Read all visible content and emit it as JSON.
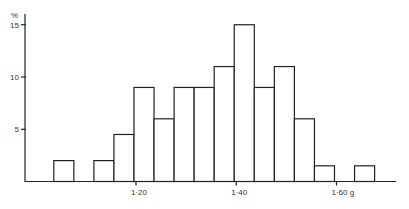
{
  "chart_data": {
    "type": "bar",
    "title": "",
    "xlabel": "g",
    "ylabel": "%",
    "ylim": [
      0,
      16
    ],
    "yticks": [
      5,
      10,
      15
    ],
    "ytick_labels": [
      "5",
      "10",
      "15"
    ],
    "xtick_labels": [
      "1·20",
      "1·40",
      "1·60 g"
    ],
    "xtick_values": [
      1.2,
      1.4,
      1.6
    ],
    "bin_width": 0.04,
    "bins": [
      {
        "x0": 1.04,
        "value": 2
      },
      {
        "x0": 1.08,
        "value": 0
      },
      {
        "x0": 1.12,
        "value": 2
      },
      {
        "x0": 1.16,
        "value": 4.5
      },
      {
        "x0": 1.2,
        "value": 9
      },
      {
        "x0": 1.24,
        "value": 6
      },
      {
        "x0": 1.28,
        "value": 9
      },
      {
        "x0": 1.32,
        "value": 9
      },
      {
        "x0": 1.36,
        "value": 11
      },
      {
        "x0": 1.4,
        "value": 15
      },
      {
        "x0": 1.44,
        "value": 9
      },
      {
        "x0": 1.48,
        "value": 11
      },
      {
        "x0": 1.52,
        "value": 6
      },
      {
        "x0": 1.56,
        "value": 1.5
      },
      {
        "x0": 1.6,
        "value": 0
      },
      {
        "x0": 1.64,
        "value": 1.5
      }
    ],
    "grid": false,
    "legend": null
  }
}
